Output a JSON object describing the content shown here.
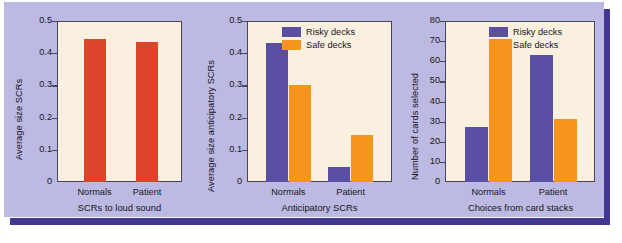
{
  "figure": {
    "panel_color": "#bcb9e2",
    "shadow_color": "#40398f",
    "plot_bg_color": "#faf0df",
    "axis_color": "#4a4458"
  },
  "legend": {
    "risky_label": "Risky decks",
    "safe_label": "Safe decks",
    "risky_color": "#5a4fa2",
    "safe_color": "#f7941e"
  },
  "chart_data": [
    {
      "type": "bar",
      "title": "",
      "xlabel": "SCRs to loud sound",
      "ylabel": "Average size SCRs",
      "categories": [
        "Normals",
        "Patient"
      ],
      "values": [
        0.445,
        0.435
      ],
      "yticks": [
        "0",
        "0.1",
        "0.2",
        "0.3",
        "0.4",
        "0.5"
      ],
      "ytick_values": [
        0,
        0.1,
        0.2,
        0.3,
        0.4,
        0.5
      ],
      "ylim": [
        0,
        0.5
      ],
      "bar_color": "#dd442a",
      "grid": false,
      "legend": "none"
    },
    {
      "type": "bar",
      "title": "",
      "xlabel": "Anticipatory SCRs",
      "ylabel": "Average size anticipatory SCRs",
      "categories": [
        "Normals",
        "Patient"
      ],
      "series": [
        {
          "name": "Risky decks",
          "values": [
            0.433,
            0.047
          ],
          "color": "#5a4fa2"
        },
        {
          "name": "Safe decks",
          "values": [
            0.301,
            0.145
          ],
          "color": "#f7941e"
        }
      ],
      "yticks": [
        "0",
        "0.1",
        "0.2",
        "0.3",
        "0.4",
        "0.5"
      ],
      "ytick_values": [
        0,
        0.1,
        0.2,
        0.3,
        0.4,
        0.5
      ],
      "ylim": [
        0,
        0.5
      ],
      "grid": false,
      "legend": "top-right"
    },
    {
      "type": "bar",
      "title": "",
      "xlabel": "Choices from card stacks",
      "ylabel": "Number of cards selected",
      "categories": [
        "Normals",
        "Patient"
      ],
      "series": [
        {
          "name": "Risky decks",
          "values": [
            27.5,
            63
          ],
          "color": "#5a4fa2"
        },
        {
          "name": "Safe decks",
          "values": [
            71,
            31.5
          ],
          "color": "#f7941e"
        }
      ],
      "yticks": [
        "0",
        "10",
        "20",
        "30",
        "40",
        "50",
        "60",
        "70",
        "80"
      ],
      "ytick_values": [
        0,
        10,
        20,
        30,
        40,
        50,
        60,
        70,
        80
      ],
      "ylim": [
        0,
        80
      ],
      "grid": false,
      "legend": "top-right"
    }
  ]
}
